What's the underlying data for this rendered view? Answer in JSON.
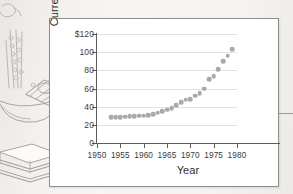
{
  "figure": {
    "background_illustration": "balance-scale-with-money-and-books-sketch",
    "panel_background": "#ffffff",
    "marker_color": "#a9a9ad",
    "axis_color": "#5b5b5b",
    "grid_color": "#e2e2e2"
  },
  "chart_data": {
    "type": "scatter",
    "title": "",
    "xlabel": "Year",
    "ylabel": "Currency (billions)",
    "xlim": [
      1950,
      1980
    ],
    "ylim": [
      0,
      120
    ],
    "xticks": [
      1950,
      1955,
      1960,
      1965,
      1970,
      1975,
      1980
    ],
    "xtick_labels": [
      "1950",
      "1955",
      "1960",
      "1965",
      "1970",
      "1975",
      "1980"
    ],
    "yticks": [
      0,
      20,
      40,
      60,
      80,
      100,
      120
    ],
    "ytick_labels": [
      "0",
      "20",
      "40",
      "60",
      "80",
      "100",
      "$120"
    ],
    "grid": "horizontal",
    "legend": "none",
    "x": [
      1953,
      1954,
      1955,
      1956,
      1957,
      1958,
      1959,
      1960,
      1961,
      1962,
      1963,
      1964,
      1965,
      1966,
      1967,
      1968,
      1969,
      1970,
      1971,
      1972,
      1973,
      1974,
      1975,
      1976,
      1977,
      1978,
      1979
    ],
    "values": [
      28.5,
      28.2,
      28.6,
      29.0,
      29.2,
      29.5,
      30.0,
      30.2,
      30.8,
      32.0,
      33.5,
      35.0,
      36.5,
      38.5,
      41.5,
      45.0,
      47.5,
      48.5,
      52.0,
      55.0,
      60.0,
      70.0,
      73.5,
      81.5,
      90.0,
      96.0,
      103.0
    ],
    "series": [
      {
        "name": "Currency in circulation",
        "values": [
          28.5,
          28.2,
          28.6,
          29.0,
          29.2,
          29.5,
          30.0,
          30.2,
          30.8,
          32.0,
          33.5,
          35.0,
          36.5,
          38.5,
          41.5,
          45.0,
          47.5,
          48.5,
          52.0,
          55.0,
          60.0,
          70.0,
          73.5,
          81.5,
          90.0,
          96.0,
          103.0
        ]
      }
    ]
  }
}
